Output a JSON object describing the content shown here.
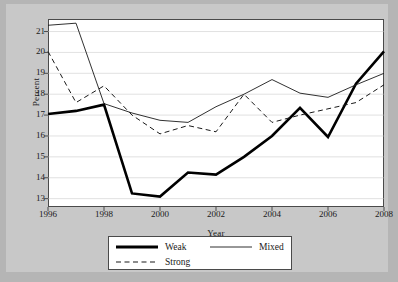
{
  "chart_data": {
    "type": "line",
    "title": "",
    "xlabel": "Year",
    "ylabel": "Percent",
    "x": [
      1996,
      1997,
      1998,
      1999,
      2000,
      2001,
      2002,
      2003,
      2004,
      2005,
      2006,
      2007,
      2008
    ],
    "xlim": [
      1996,
      2008
    ],
    "ylim": [
      12.6,
      21.6
    ],
    "yticks": [
      13,
      14,
      15,
      16,
      17,
      18,
      19,
      20,
      21
    ],
    "xticks": [
      1996,
      1998,
      2000,
      2002,
      2004,
      2006,
      2008
    ],
    "xtick_labels": [
      "1996",
      "1998",
      "2000",
      "2002",
      "2004",
      "2006",
      "2008"
    ],
    "ytick_labels": [
      "13",
      "14",
      "15",
      "16",
      "17",
      "18",
      "19",
      "20",
      "21"
    ],
    "grid": true,
    "grid_axis": "y",
    "legend_position": "below-axes",
    "series": [
      {
        "name": "Weak",
        "style": "solid",
        "width": 2.6,
        "color": "#000000",
        "values": [
          17.05,
          17.2,
          17.5,
          13.25,
          13.1,
          14.25,
          14.15,
          15.0,
          16.0,
          17.35,
          15.95,
          18.5,
          20.05
        ]
      },
      {
        "name": "Mixed",
        "style": "solid",
        "width": 0.9,
        "color": "#1a1a1a",
        "values": [
          21.3,
          21.4,
          17.55,
          17.1,
          16.75,
          16.65,
          17.4,
          18.0,
          18.7,
          18.05,
          17.85,
          18.45,
          19.0
        ]
      },
      {
        "name": "Strong",
        "style": "dashed",
        "width": 1.0,
        "color": "#1a1a1a",
        "values": [
          20.05,
          17.6,
          18.4,
          17.0,
          16.1,
          16.5,
          16.2,
          18.0,
          16.65,
          17.0,
          17.3,
          17.6,
          18.45
        ]
      }
    ]
  },
  "legend": {
    "items": [
      {
        "label": "Weak"
      },
      {
        "label": "Mixed"
      },
      {
        "label": "Strong"
      }
    ]
  },
  "colors": {
    "figure_background": "#c8c8c8",
    "page_background": "#b5b5b5",
    "plot_background": "#ffffff",
    "axis": "#4a4a4a",
    "grid": "#d9d9d9",
    "text": "#1a1a1a"
  }
}
